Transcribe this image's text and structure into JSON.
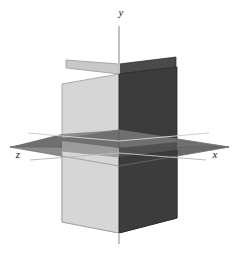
{
  "figure": {
    "name": "three-coordinate-planes-3d",
    "background_color": "#ffffff",
    "width": 238,
    "height": 253
  },
  "axes": [
    {
      "id": "y",
      "label": "y",
      "label_x": 121,
      "label_y": 16,
      "orientation": "vertical"
    },
    {
      "id": "x",
      "label": "x",
      "label_x": 215,
      "label_y": 158,
      "orientation": "right"
    },
    {
      "id": "z",
      "label": "z",
      "label_x": 18,
      "label_y": 158,
      "orientation": "left"
    }
  ],
  "colors": {
    "plane_light": "#d6d6d6",
    "plane_dark": "#3c3c3c",
    "plane_mid": "#8b8b8b",
    "plane_mid_dark": "#6f6f6f",
    "plane_back_dark": "#4a4a4a",
    "plane_back_light": "#c8c8c8",
    "edge_light": "#9a9a9a",
    "edge_dark": "#2a2a2a",
    "axis_line": "#b9b9b9",
    "axis_line_dark": "#8f8f8f",
    "label_text": "#1a1a1a"
  },
  "geometry": {
    "origin": {
      "x": 119,
      "y": 148
    },
    "y_axis": {
      "top_x": 119,
      "top_y": 26,
      "bottom_x": 119,
      "bottom_y": 244
    },
    "x_axis": {
      "end_x": 205,
      "end_y": 160
    },
    "z_axis": {
      "end_x": 32,
      "end_y": 160
    },
    "horizontal_plane_vertices": [
      {
        "x": 119,
        "y": 130
      },
      {
        "x": 229,
        "y": 147
      },
      {
        "x": 119,
        "y": 166
      },
      {
        "x": 10,
        "y": 147
      }
    ],
    "left_plane_vertices": [
      {
        "x": 62,
        "y": 84
      },
      {
        "x": 119,
        "y": 74
      },
      {
        "x": 119,
        "y": 233
      },
      {
        "x": 62,
        "y": 222
      }
    ],
    "right_plane_vertices": [
      {
        "x": 119,
        "y": 74
      },
      {
        "x": 177,
        "y": 67
      },
      {
        "x": 177,
        "y": 218
      },
      {
        "x": 119,
        "y": 233
      }
    ],
    "back_left_sliver_vertices": [
      {
        "x": 66,
        "y": 68
      },
      {
        "x": 119,
        "y": 74
      },
      {
        "x": 119,
        "y": 64
      },
      {
        "x": 66,
        "y": 60
      }
    ],
    "back_right_sliver_vertices": [
      {
        "x": 119,
        "y": 64
      },
      {
        "x": 176,
        "y": 57
      },
      {
        "x": 176,
        "y": 67
      },
      {
        "x": 119,
        "y": 74
      }
    ]
  }
}
